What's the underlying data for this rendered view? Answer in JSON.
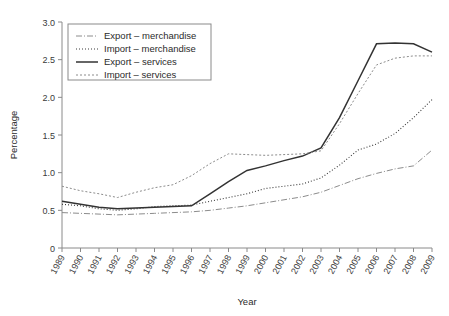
{
  "chart_data": {
    "type": "line",
    "title": "",
    "xlabel": "Year",
    "ylabel": "Percentage",
    "xlim": [
      1989,
      2009
    ],
    "ylim": [
      0,
      3.0
    ],
    "yticks": [
      "0",
      "0.5",
      "1.0",
      "1.5",
      "2.0",
      "2.5",
      "3.0"
    ],
    "ytick_values": [
      0,
      0.5,
      1.0,
      1.5,
      2.0,
      2.5,
      3.0
    ],
    "grid": false,
    "legend_position": "upper left",
    "x": [
      1989,
      1990,
      1991,
      1992,
      1993,
      1994,
      1995,
      1996,
      1997,
      1998,
      1999,
      2000,
      2001,
      2002,
      2003,
      2004,
      2005,
      2006,
      2007,
      2008,
      2009
    ],
    "categories": [
      "1989",
      "1990",
      "1991",
      "1992",
      "1993",
      "1994",
      "1995",
      "1996",
      "1997",
      "1998",
      "1999",
      "2000",
      "2001",
      "2002",
      "2003",
      "2004",
      "2005",
      "2006",
      "2007",
      "2008",
      "2009"
    ],
    "series": [
      {
        "name": "Export – merchandise",
        "style": "dash-dot",
        "color": "#8c8c8c",
        "values": [
          0.47,
          0.46,
          0.45,
          0.44,
          0.45,
          0.46,
          0.47,
          0.48,
          0.5,
          0.53,
          0.56,
          0.6,
          0.64,
          0.68,
          0.74,
          0.83,
          0.92,
          0.99,
          1.05,
          1.09,
          1.3
        ]
      },
      {
        "name": "Import – merchandise",
        "style": "dotted",
        "color": "#3a3a3a",
        "values": [
          0.58,
          0.56,
          0.52,
          0.5,
          0.52,
          0.55,
          0.56,
          0.57,
          0.62,
          0.67,
          0.72,
          0.79,
          0.82,
          0.85,
          0.93,
          1.1,
          1.3,
          1.38,
          1.52,
          1.73,
          1.97
        ]
      },
      {
        "name": "Export – services",
        "style": "solid",
        "color": "#333333",
        "values": [
          0.62,
          0.58,
          0.54,
          0.52,
          0.53,
          0.54,
          0.55,
          0.56,
          0.72,
          0.88,
          1.03,
          1.09,
          1.16,
          1.22,
          1.33,
          1.73,
          2.22,
          2.71,
          2.72,
          2.71,
          2.6
        ]
      },
      {
        "name": "Import – services",
        "style": "dashed-fine",
        "color": "#8c8c8c",
        "values": [
          0.82,
          0.76,
          0.72,
          0.67,
          0.74,
          0.8,
          0.84,
          0.96,
          1.12,
          1.25,
          1.24,
          1.23,
          1.24,
          1.25,
          1.29,
          1.65,
          2.05,
          2.43,
          2.52,
          2.55,
          2.55
        ]
      }
    ]
  },
  "axes": {
    "ylabel": "Percentage",
    "xlabel": "Year"
  },
  "legend": {
    "entries": [
      {
        "label": "Export – merchandise"
      },
      {
        "label": "Import – merchandise"
      },
      {
        "label": "Export – services"
      },
      {
        "label": "Import – services"
      }
    ]
  }
}
